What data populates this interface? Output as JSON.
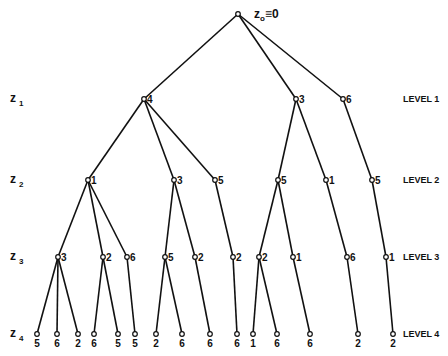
{
  "diagram": {
    "type": "tree",
    "root": {
      "id": "r",
      "label_var": "z",
      "label_sub": "o",
      "label_rest": "≡0",
      "x": 238,
      "y": 14
    },
    "levels": [
      {
        "var": "z",
        "sub": "1",
        "name": "LEVEL 1",
        "y": 99
      },
      {
        "var": "z",
        "sub": "2",
        "name": "LEVEL 2",
        "y": 180
      },
      {
        "var": "z",
        "sub": "3",
        "name": "LEVEL 3",
        "y": 257
      },
      {
        "var": "z",
        "sub": "4",
        "name": "LEVEL 4",
        "y": 334
      }
    ],
    "nodes": [
      {
        "id": "a",
        "parent": "r",
        "level": 1,
        "value": "4",
        "x": 144,
        "y": 99
      },
      {
        "id": "b",
        "parent": "r",
        "level": 1,
        "value": "3",
        "x": 296,
        "y": 99
      },
      {
        "id": "c",
        "parent": "r",
        "level": 1,
        "value": "6",
        "x": 343,
        "y": 99
      },
      {
        "id": "a1",
        "parent": "a",
        "level": 2,
        "value": "1",
        "x": 88,
        "y": 180
      },
      {
        "id": "a2",
        "parent": "a",
        "level": 2,
        "value": "3",
        "x": 174,
        "y": 180
      },
      {
        "id": "a3",
        "parent": "a",
        "level": 2,
        "value": "5",
        "x": 215,
        "y": 180
      },
      {
        "id": "b1",
        "parent": "b",
        "level": 2,
        "value": "5",
        "x": 278,
        "y": 180
      },
      {
        "id": "b2",
        "parent": "b",
        "level": 2,
        "value": "1",
        "x": 326,
        "y": 180
      },
      {
        "id": "c1",
        "parent": "c",
        "level": 2,
        "value": "5",
        "x": 372,
        "y": 180
      },
      {
        "id": "a1a",
        "parent": "a1",
        "level": 3,
        "value": "3",
        "x": 58,
        "y": 257
      },
      {
        "id": "a1b",
        "parent": "a1",
        "level": 3,
        "value": "2",
        "x": 103,
        "y": 257
      },
      {
        "id": "a1c",
        "parent": "a1",
        "level": 3,
        "value": "6",
        "x": 127,
        "y": 257
      },
      {
        "id": "a2a",
        "parent": "a2",
        "level": 3,
        "value": "5",
        "x": 165,
        "y": 257
      },
      {
        "id": "a2b",
        "parent": "a2",
        "level": 3,
        "value": "2",
        "x": 195,
        "y": 257
      },
      {
        "id": "a3a",
        "parent": "a3",
        "level": 3,
        "value": "2",
        "x": 233,
        "y": 257
      },
      {
        "id": "b1a",
        "parent": "b1",
        "level": 3,
        "value": "2",
        "x": 259,
        "y": 257
      },
      {
        "id": "b1b",
        "parent": "b1",
        "level": 3,
        "value": "1",
        "x": 293,
        "y": 257
      },
      {
        "id": "b2a",
        "parent": "b2",
        "level": 3,
        "value": "6",
        "x": 347,
        "y": 257
      },
      {
        "id": "c1a",
        "parent": "c1",
        "level": 3,
        "value": "1",
        "x": 386,
        "y": 257
      },
      {
        "id": "l1",
        "parent": "a1a",
        "level": 4,
        "value": "5",
        "x": 37,
        "y": 334
      },
      {
        "id": "l2",
        "parent": "a1a",
        "level": 4,
        "value": "6",
        "x": 57,
        "y": 334
      },
      {
        "id": "l3",
        "parent": "a1a",
        "level": 4,
        "value": "2",
        "x": 78,
        "y": 334
      },
      {
        "id": "l4",
        "parent": "a1b",
        "level": 4,
        "value": "6",
        "x": 94,
        "y": 334
      },
      {
        "id": "l5",
        "parent": "a1b",
        "level": 4,
        "value": "5",
        "x": 118,
        "y": 334
      },
      {
        "id": "l6",
        "parent": "a1c",
        "level": 4,
        "value": "5",
        "x": 135,
        "y": 334
      },
      {
        "id": "l7",
        "parent": "a2a",
        "level": 4,
        "value": "2",
        "x": 156,
        "y": 334
      },
      {
        "id": "l8",
        "parent": "a2a",
        "level": 4,
        "value": "6",
        "x": 182,
        "y": 334
      },
      {
        "id": "l9",
        "parent": "a2b",
        "level": 4,
        "value": "6",
        "x": 210,
        "y": 334
      },
      {
        "id": "l10",
        "parent": "a3a",
        "level": 4,
        "value": "6",
        "x": 237,
        "y": 334
      },
      {
        "id": "l11",
        "parent": "b1a",
        "level": 4,
        "value": "1",
        "x": 253,
        "y": 334
      },
      {
        "id": "l12",
        "parent": "b1a",
        "level": 4,
        "value": "6",
        "x": 277,
        "y": 334
      },
      {
        "id": "l13",
        "parent": "b1b",
        "level": 4,
        "value": "6",
        "x": 310,
        "y": 334
      },
      {
        "id": "l14",
        "parent": "b2a",
        "level": 4,
        "value": "2",
        "x": 358,
        "y": 334
      },
      {
        "id": "l15",
        "parent": "c1a",
        "level": 4,
        "value": "2",
        "x": 393,
        "y": 334
      }
    ]
  }
}
